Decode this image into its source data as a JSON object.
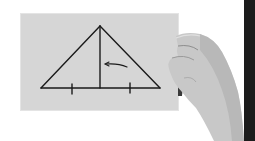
{
  "image": {
    "description": "Hand holding a gray card with a hand-drawn isosceles triangle, its altitude, tick marks on the base and an arrow pointing at the altitude",
    "background_color": "#ffffff",
    "card_color": "#d6d6d6",
    "ink_color": "#1a1a1a",
    "skin_color": "#c9c9c9",
    "edge_color": "#1c1c1c"
  },
  "diagram": {
    "shape": "isosceles triangle",
    "apex": [
      100,
      26
    ],
    "base_left": [
      41,
      88
    ],
    "base_right": [
      160,
      88
    ],
    "altitude_foot": [
      100,
      88
    ],
    "tick_marks_x": [
      72,
      130
    ],
    "arrow": {
      "from": [
        127,
        67
      ],
      "to": [
        105,
        64
      ],
      "direction": "left"
    }
  }
}
